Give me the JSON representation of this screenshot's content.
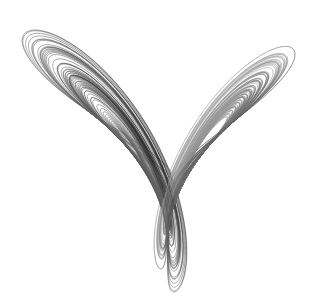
{
  "figure": {
    "background": "#ffffff",
    "stroke_color": "#1a1a1a",
    "faint_stroke_color": "#9a9a9a",
    "params": {
      "sigma": 10,
      "rho": 28,
      "beta": 2.6667
    },
    "lobes": [
      {
        "name": "left-lobe",
        "eye_center": [
          103,
          155
        ]
      },
      {
        "name": "right-lobe",
        "eye_center": [
          208,
          155
        ]
      }
    ],
    "bounds": {
      "left": 22,
      "right": 295,
      "top": 30,
      "bottom": 292
    }
  }
}
